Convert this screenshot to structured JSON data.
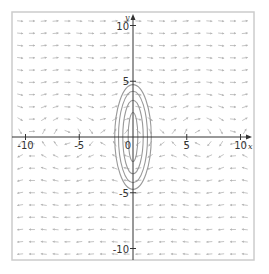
{
  "chart_data": {
    "type": "vector_field",
    "title": "",
    "xlabel": "x",
    "ylabel": "y",
    "xlim": [
      -11,
      11
    ],
    "ylim": [
      -11,
      11
    ],
    "grid": false,
    "x_ticks": [
      -10,
      -5,
      0,
      5,
      10
    ],
    "y_ticks": [
      -10,
      -5,
      5,
      10
    ],
    "x_tick_labels": [
      "-10",
      "-5",
      "0",
      "5",
      "10"
    ],
    "y_tick_labels": [
      "-10",
      "-5",
      "5",
      "10"
    ],
    "field": {
      "description": "direction field dx/dt = y, dy/dt = -sin(x)",
      "dx": "y",
      "dy": "-sin(x)",
      "grid_spacing": 1.1,
      "arrow_length": 0.6,
      "color": "#b5b5b5"
    },
    "contours": {
      "description": "closed orbits (nested ellipses) around the origin",
      "color": "#9a9a9a",
      "ellipses": [
        {
          "a": 0.45,
          "b": 2.2
        },
        {
          "a": 0.95,
          "b": 3.3
        },
        {
          "a": 1.35,
          "b": 4.1
        },
        {
          "a": 1.7,
          "b": 4.7
        }
      ]
    }
  },
  "layout": {
    "frame": {
      "left": 12,
      "top": 12,
      "right": 254,
      "bottom": 260,
      "color": "#cccccc"
    },
    "origin_px": {
      "x": 133,
      "y": 137
    },
    "scale_px": {
      "x": 10.75,
      "y": 11.15
    },
    "axis_color": "#333333"
  }
}
